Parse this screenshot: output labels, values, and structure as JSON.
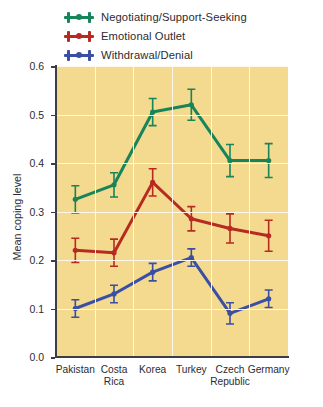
{
  "chart_data": {
    "type": "line",
    "title": "",
    "xlabel": "",
    "ylabel": "Mean coping level",
    "ylim": [
      0.0,
      0.6
    ],
    "ytick_labels": [
      "0.0",
      "0.1",
      "0.2",
      "0.3",
      "0.4",
      "0.5",
      "0.6"
    ],
    "ytick_values": [
      0.0,
      0.1,
      0.2,
      0.3,
      0.4,
      0.5,
      0.6
    ],
    "grid": true,
    "legend_position": "top-left",
    "plot_background": "#f3da8e",
    "gridline_color": "#fdfaf0",
    "categories": [
      "Pakistan",
      "Costa Rica",
      "Korea",
      "Turkey",
      "Czech Republic",
      "Germany"
    ],
    "category_lines": [
      [
        "Pakistan",
        ""
      ],
      [
        "Costa",
        "Rica"
      ],
      [
        "Korea",
        ""
      ],
      [
        "Turkey",
        ""
      ],
      [
        "Czech",
        "Republic"
      ],
      [
        "Germany",
        ""
      ]
    ],
    "series": [
      {
        "name": "Negotiating/Support-Seeking",
        "color": "#17845a",
        "values": [
          0.325,
          0.355,
          0.505,
          0.52,
          0.405,
          0.405
        ],
        "errors": [
          0.028,
          0.025,
          0.028,
          0.032,
          0.033,
          0.035
        ]
      },
      {
        "name": "Emotional Outlet",
        "color": "#b72a22",
        "values": [
          0.22,
          0.215,
          0.36,
          0.285,
          0.265,
          0.25
        ],
        "errors": [
          0.025,
          0.028,
          0.028,
          0.025,
          0.03,
          0.032
        ]
      },
      {
        "name": "Withdrawal/Denial",
        "color": "#3a4fa3",
        "values": [
          0.1,
          0.13,
          0.175,
          0.205,
          0.09,
          0.12
        ],
        "errors": [
          0.018,
          0.018,
          0.018,
          0.018,
          0.022,
          0.018
        ]
      }
    ]
  },
  "legend": {
    "items": [
      {
        "label": "Negotiating/Support-Seeking",
        "color": "#17845a"
      },
      {
        "label": "Emotional Outlet",
        "color": "#b72a22"
      },
      {
        "label": "Withdrawal/Denial",
        "color": "#3a4fa3"
      }
    ]
  }
}
